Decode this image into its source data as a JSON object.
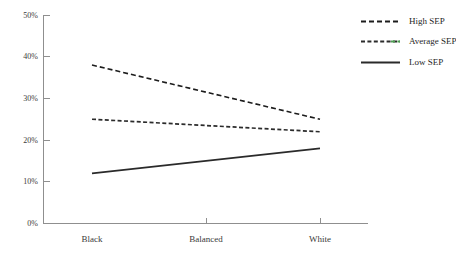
{
  "chart_data": {
    "type": "line",
    "title": "",
    "xlabel": "",
    "ylabel": "",
    "categories": [
      "Black",
      "Balanced",
      "White"
    ],
    "x": [
      0,
      1,
      2
    ],
    "xlim": [
      -0.43,
      2.42
    ],
    "ylim": [
      0,
      50
    ],
    "yticks": [
      0,
      10,
      20,
      30,
      40,
      50
    ],
    "ytick_labels": [
      "0%",
      "10%",
      "20%",
      "30%",
      "40%",
      "50%"
    ],
    "grid": false,
    "legend_position": "right",
    "series": [
      {
        "name": "High SEP",
        "values": [
          38,
          31.5,
          25
        ],
        "color": "#1c1c1c",
        "style": "dashed",
        "dasharray": "5,3",
        "width": 1.6
      },
      {
        "name": "Average SEP",
        "values": [
          25,
          23.5,
          22
        ],
        "color": "#2b2b2b",
        "accent_color": "#4f9f54",
        "style": "dotted",
        "dasharray": "4,2.4",
        "width": 1.7
      },
      {
        "name": "Low SEP",
        "values": [
          12,
          15,
          18
        ],
        "color": "#2a2a2a",
        "style": "solid",
        "dasharray": "none",
        "width": 1.7
      }
    ],
    "axis_color": "#8f8f8f",
    "background": "#ffffff"
  },
  "legend": {
    "entries": [
      {
        "label": "High SEP"
      },
      {
        "label": "Average SEP"
      },
      {
        "label": "Low SEP"
      }
    ]
  },
  "axes": {
    "y_labels": [
      "50%",
      "40%",
      "30%",
      "20%",
      "10%",
      "0%"
    ],
    "x_labels": [
      "Black",
      "Balanced",
      "White"
    ]
  }
}
